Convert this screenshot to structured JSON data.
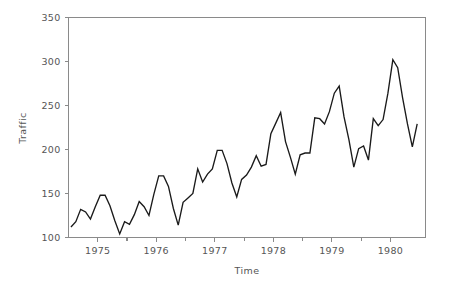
{
  "chart_data": {
    "type": "line",
    "title": "",
    "xlabel": "Time",
    "ylabel": "Traffic",
    "xlim": [
      1974.5,
      1980.6
    ],
    "ylim": [
      100,
      350
    ],
    "grid": false,
    "legend": null,
    "y_ticks": [
      100,
      150,
      200,
      250,
      300,
      350
    ],
    "y_tick_labels": [
      "100",
      "150",
      "200",
      "250",
      "300",
      "350"
    ],
    "x_ticks": [
      1975,
      1976,
      1977,
      1978,
      1979,
      1980
    ],
    "x_tick_labels": [
      "1975",
      "1976",
      "1977",
      "1978",
      "1979",
      "1980"
    ],
    "x_minor_ticks": [
      1975.5,
      1976.5,
      1977.5,
      1978.5,
      1979.5
    ],
    "series": [
      {
        "name": "Traffic",
        "color": "#1a1a1a",
        "x": [
          1974.542,
          1974.625,
          1974.708,
          1974.792,
          1974.875,
          1974.958,
          1975.042,
          1975.125,
          1975.208,
          1975.292,
          1975.375,
          1975.458,
          1975.542,
          1975.625,
          1975.708,
          1975.792,
          1975.875,
          1975.958,
          1976.042,
          1976.125,
          1976.208,
          1976.292,
          1976.375,
          1976.458,
          1976.542,
          1976.625,
          1976.708,
          1976.792,
          1976.875,
          1976.958,
          1977.042,
          1977.125,
          1977.208,
          1977.292,
          1977.375,
          1977.458,
          1977.542,
          1977.625,
          1977.708,
          1977.792,
          1977.875,
          1977.958,
          1978.042,
          1978.125,
          1978.208,
          1978.292,
          1978.375,
          1978.458,
          1978.542,
          1978.625,
          1978.708,
          1978.792,
          1978.875,
          1978.958,
          1979.042,
          1979.125,
          1979.208,
          1979.292,
          1979.375,
          1979.458,
          1979.542,
          1979.625,
          1979.708,
          1979.792,
          1979.875,
          1979.958,
          1980.042,
          1980.125,
          1980.208,
          1980.292,
          1980.375,
          1980.458
        ],
        "values": [
          112,
          118,
          132,
          129,
          121,
          135,
          148,
          148,
          136,
          119,
          104,
          118,
          115,
          126,
          141,
          135,
          125,
          149,
          170,
          170,
          158,
          133,
          114,
          140,
          145,
          150,
          178,
          163,
          172,
          178,
          199,
          199,
          184,
          162,
          146,
          166,
          171,
          180,
          193,
          181,
          183,
          218,
          230,
          242,
          209,
          191,
          172,
          194,
          196,
          196,
          236,
          235,
          229,
          243,
          264,
          272,
          237,
          211,
          180,
          201,
          204,
          188,
          235,
          227,
          234,
          264,
          302,
          293,
          259,
          229,
          203,
          229
        ]
      }
    ]
  },
  "axes": {
    "ylabel": "Traffic",
    "xlabel": "Time"
  }
}
